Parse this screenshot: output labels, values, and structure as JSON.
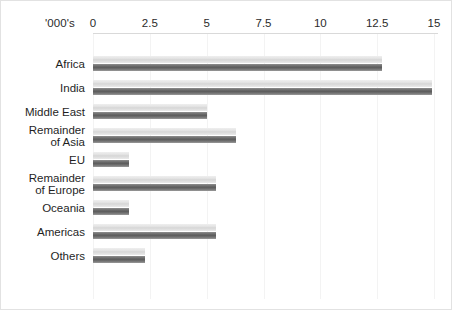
{
  "chart_data": {
    "type": "bar",
    "title": "",
    "subtitle": "",
    "xlabel": "'000's",
    "ylabel": "",
    "orientation": "horizontal",
    "xlim": [
      0,
      15
    ],
    "grid": true,
    "legend": "none",
    "xticks": [
      0,
      2.5,
      5,
      7.5,
      10,
      12.5,
      15
    ],
    "xtick_labels": [
      "0",
      "2.5",
      "5",
      "7.5",
      "10",
      "12.5",
      "15"
    ],
    "categories": [
      "Africa",
      "India",
      "Middle East",
      "Remainder\nof Asia",
      "EU",
      "Remainder\nof Europe",
      "Oceania",
      "Americas",
      "Others"
    ],
    "series": [
      {
        "name": "light",
        "color": "#dcdcdc",
        "values": [
          12.7,
          14.9,
          5.0,
          6.3,
          1.6,
          5.4,
          1.6,
          5.4,
          2.3
        ]
      },
      {
        "name": "dark",
        "color": "#666666",
        "values": [
          12.7,
          14.9,
          5.0,
          6.3,
          1.6,
          5.4,
          1.6,
          5.4,
          2.3
        ]
      }
    ]
  },
  "colors": {
    "background": "#ffffff",
    "border": "#e2e2e2",
    "gridline": "#f3f3f3",
    "axis_rule": "#d9d9d9",
    "text": "#1f1f1f",
    "bar_light": "#dcdcdc",
    "bar_dark": "#666666"
  }
}
